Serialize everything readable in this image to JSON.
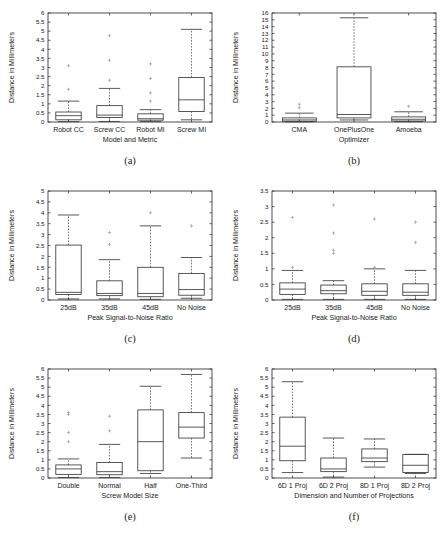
{
  "figure": {
    "background_color": "#ffffff",
    "line_color": "#3b3b3b",
    "text_color": "#1a1a1a",
    "rows": 3,
    "cols": 2
  },
  "chart_data": [
    {
      "type": "box",
      "panel_label": "(a)",
      "title": "",
      "xlabel": "Model and Metric",
      "ylabel": "Distance in Millimeters",
      "ylim": [
        0,
        6
      ],
      "ytick_step": 0.5,
      "yticks": [
        "0",
        "0.5",
        "1",
        "1.5",
        "2",
        "2.5",
        "3",
        "3.5",
        "4",
        "4.5",
        "5",
        "5.5",
        "6"
      ],
      "categories": [
        "Robot CC",
        "Screw CC",
        "Robot MI",
        "Screw MI"
      ],
      "boxes": [
        {
          "category": "Robot CC",
          "whisker_low": 0.02,
          "q1": 0.12,
          "median": 0.35,
          "q3": 0.55,
          "whisker_high": 1.15,
          "outliers": [
            1.8,
            3.1
          ]
        },
        {
          "category": "Screw CC",
          "whisker_low": 0.03,
          "q1": 0.25,
          "median": 0.38,
          "q3": 0.9,
          "whisker_high": 1.85,
          "outliers": [
            2.3,
            3.4,
            4.75
          ]
        },
        {
          "category": "Robot MI",
          "whisker_low": 0.02,
          "q1": 0.1,
          "median": 0.18,
          "q3": 0.45,
          "whisker_high": 0.68,
          "outliers": [
            1.15,
            1.6,
            2.4,
            3.2
          ]
        },
        {
          "category": "Screw MI",
          "whisker_low": 0.12,
          "q1": 0.58,
          "median": 1.22,
          "q3": 2.45,
          "whisker_high": 5.1,
          "outliers": []
        }
      ]
    },
    {
      "type": "box",
      "panel_label": "(b)",
      "title": "",
      "xlabel": "Optimizer",
      "ylabel": "Distance in Millimeters",
      "ylim": [
        0,
        16
      ],
      "ytick_step": 1,
      "yticks": [
        "0",
        "1",
        "2",
        "3",
        "4",
        "5",
        "6",
        "7",
        "8",
        "9",
        "10",
        "11",
        "12",
        "13",
        "14",
        "15",
        "16"
      ],
      "categories": [
        "CMA",
        "OnePlusOne",
        "Amoeba"
      ],
      "boxes": [
        {
          "category": "CMA",
          "whisker_low": 0.02,
          "q1": 0.1,
          "median": 0.3,
          "q3": 0.6,
          "whisker_high": 1.3,
          "outliers": [
            2.1,
            2.6
          ]
        },
        {
          "category": "OnePlusOne",
          "whisker_low": 0.3,
          "q1": 0.6,
          "median": 1.1,
          "q3": 8.1,
          "whisker_high": 15.3,
          "outliers": []
        },
        {
          "category": "Amoeba",
          "whisker_low": 0.05,
          "q1": 0.15,
          "median": 0.4,
          "q3": 0.75,
          "whisker_high": 1.5,
          "outliers": [
            2.3
          ]
        }
      ]
    },
    {
      "type": "box",
      "panel_label": "(c)",
      "title": "",
      "xlabel": "Peak Signal-to-Noise Ratio",
      "ylabel": "Distance in Millimeters",
      "ylim": [
        0,
        5
      ],
      "ytick_step": 0.5,
      "yticks": [
        "0",
        "0.5",
        "1",
        "1.5",
        "2",
        "2.5",
        "3",
        "3.5",
        "4",
        "4.5",
        "5"
      ],
      "categories": [
        "25dB",
        "35dB",
        "45dB",
        "No Noise"
      ],
      "boxes": [
        {
          "category": "25dB",
          "whisker_low": 0.05,
          "q1": 0.25,
          "median": 0.35,
          "q3": 2.52,
          "whisker_high": 3.9,
          "outliers": []
        },
        {
          "category": "35dB",
          "whisker_low": 0.05,
          "q1": 0.2,
          "median": 0.3,
          "q3": 0.88,
          "whisker_high": 1.85,
          "outliers": [
            2.55,
            3.1
          ]
        },
        {
          "category": "45dB",
          "whisker_low": 0.03,
          "q1": 0.15,
          "median": 0.3,
          "q3": 1.5,
          "whisker_high": 3.4,
          "outliers": [
            4.0
          ]
        },
        {
          "category": "No Noise",
          "whisker_low": 0.08,
          "q1": 0.22,
          "median": 0.48,
          "q3": 1.22,
          "whisker_high": 1.95,
          "outliers": [
            3.4
          ]
        }
      ]
    },
    {
      "type": "box",
      "panel_label": "(d)",
      "title": "",
      "xlabel": "Peak Signal-to-Noise Ratio",
      "ylabel": "Distance in Millimeters",
      "ylim": [
        0,
        3.5
      ],
      "ytick_step": 0.5,
      "yticks": [
        "0",
        "0.5",
        "1",
        "1.5",
        "2",
        "2.5",
        "3",
        "3.5"
      ],
      "categories": [
        "25dB",
        "35dB",
        "45dB",
        "No Noise"
      ],
      "boxes": [
        {
          "category": "25dB",
          "whisker_low": 0.02,
          "q1": 0.18,
          "median": 0.35,
          "q3": 0.55,
          "whisker_high": 0.95,
          "outliers": [
            1.05,
            2.65
          ]
        },
        {
          "category": "35dB",
          "whisker_low": 0.02,
          "q1": 0.2,
          "median": 0.3,
          "q3": 0.48,
          "whisker_high": 0.62,
          "outliers": [
            1.5,
            1.6,
            2.15,
            3.05
          ]
        },
        {
          "category": "45dB",
          "whisker_low": 0.02,
          "q1": 0.15,
          "median": 0.28,
          "q3": 0.52,
          "whisker_high": 1.0,
          "outliers": [
            1.05,
            2.6
          ]
        },
        {
          "category": "No Noise",
          "whisker_low": 0.02,
          "q1": 0.15,
          "median": 0.25,
          "q3": 0.52,
          "whisker_high": 0.95,
          "outliers": [
            1.85,
            2.5
          ]
        }
      ]
    },
    {
      "type": "box",
      "panel_label": "(e)",
      "title": "",
      "xlabel": "Screw Model Size",
      "ylabel": "Distance in Millimeters",
      "ylim": [
        0,
        6
      ],
      "ytick_step": 0.5,
      "yticks": [
        "0",
        "0.5",
        "1",
        "1.5",
        "2",
        "2.5",
        "3",
        "3.5",
        "4",
        "4.5",
        "5",
        "5.5",
        "6"
      ],
      "categories": [
        "Double",
        "Normal",
        "Half",
        "One-Third"
      ],
      "boxes": [
        {
          "category": "Double",
          "whisker_low": 0.03,
          "q1": 0.2,
          "median": 0.5,
          "q3": 0.72,
          "whisker_high": 1.05,
          "outliers": [
            2.0,
            2.5,
            3.5,
            3.6
          ]
        },
        {
          "category": "Normal",
          "whisker_low": 0.03,
          "q1": 0.18,
          "median": 0.35,
          "q3": 0.85,
          "whisker_high": 1.85,
          "outliers": [
            2.6,
            3.4
          ]
        },
        {
          "category": "Half",
          "whisker_low": 0.25,
          "q1": 0.4,
          "median": 2.0,
          "q3": 3.75,
          "whisker_high": 5.05,
          "outliers": []
        },
        {
          "category": "One-Third",
          "whisker_low": 1.1,
          "q1": 2.2,
          "median": 2.8,
          "q3": 3.6,
          "whisker_high": 5.7,
          "outliers": []
        }
      ]
    },
    {
      "type": "box",
      "panel_label": "(f)",
      "title": "",
      "xlabel": "Dimension and Number of Projections",
      "ylabel": "Distance in Millimeters",
      "ylim": [
        0,
        6
      ],
      "ytick_step": 0.5,
      "yticks": [
        "0",
        "0.5",
        "1",
        "1.5",
        "2",
        "2.5",
        "3",
        "3.5",
        "4",
        "4.5",
        "5",
        "5.5",
        "6"
      ],
      "categories": [
        "6D 1 Proj",
        "6D 2 Proj",
        "8D 1 Proj",
        "8D 2 Proj"
      ],
      "boxes": [
        {
          "category": "6D 1 Proj",
          "whisker_low": 0.3,
          "q1": 0.95,
          "median": 1.75,
          "q3": 3.35,
          "whisker_high": 5.3,
          "outliers": []
        },
        {
          "category": "6D 2 Proj",
          "whisker_low": 0.05,
          "q1": 0.35,
          "median": 0.5,
          "q3": 1.1,
          "whisker_high": 2.2,
          "outliers": []
        },
        {
          "category": "8D 1 Proj",
          "whisker_low": 0.6,
          "q1": 0.9,
          "median": 1.1,
          "q3": 1.6,
          "whisker_high": 2.15,
          "outliers": []
        },
        {
          "category": "8D 2 Proj",
          "whisker_low": 0.25,
          "q1": 0.3,
          "median": 0.7,
          "q3": 1.3,
          "whisker_high": 1.3,
          "outliers": []
        }
      ]
    }
  ]
}
